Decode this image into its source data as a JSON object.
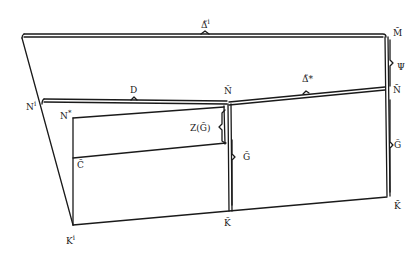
{
  "diagram": {
    "type": "commutative-lattice-diagram",
    "labels": {
      "delta_tilde_i": "Δ̃",
      "delta_tilde_i_sup": "i",
      "m_bar": "M̄",
      "psi": "Ψ",
      "n_bar": "N̄",
      "delta_tilde_star": "Δ̃*",
      "n_tilde": "Ñ",
      "d": "D",
      "n_i": "N",
      "n_i_sup": "i",
      "n_star": "N",
      "n_star_sup": "*",
      "z_g_tilde": "Z(G̃)",
      "g_tilde": "G̃",
      "g_bar": "Ḡ",
      "c_tilde": "C̃",
      "k_tilde": "K̃",
      "k_bar": "K̄",
      "k_i": "K",
      "k_i_sup": "i"
    }
  }
}
